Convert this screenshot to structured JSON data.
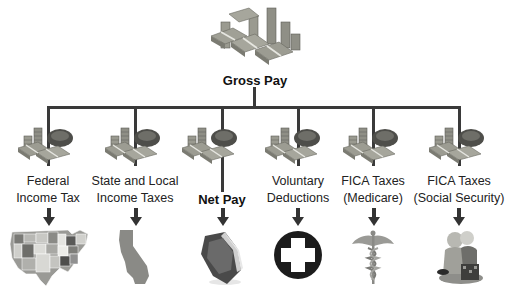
{
  "diagram": {
    "root": {
      "label": "Gross Pay",
      "icon": "money-pile-icon"
    },
    "colors": {
      "connector": "#3a3a3a",
      "money": "#8a8a80",
      "money_dark": "#5e5e58",
      "text": "#222222"
    },
    "branches": [
      {
        "label_line1": "Federal",
        "label_line2": "Income Tax",
        "icon": "us-map-icon",
        "bold": false
      },
      {
        "label_line1": "State and Local",
        "label_line2": "Income Taxes",
        "icon": "california-map-icon",
        "bold": false
      },
      {
        "label_line1": "Net Pay",
        "label_line2": "",
        "icon": "wallet-icon",
        "bold": true
      },
      {
        "label_line1": "Voluntary",
        "label_line2": "Deductions",
        "icon": "medical-cross-icon",
        "bold": false
      },
      {
        "label_line1": "FICA Taxes",
        "label_line2": "(Medicare)",
        "icon": "caduceus-icon",
        "bold": false
      },
      {
        "label_line1": "FICA Taxes",
        "label_line2": "(Social Security)",
        "icon": "elderly-couple-icon",
        "bold": false
      }
    ]
  }
}
